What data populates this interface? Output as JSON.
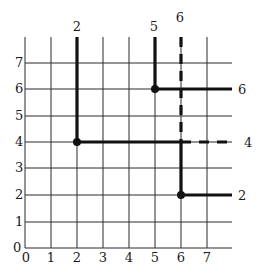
{
  "diagram": {
    "type": "grid-path-diagram",
    "grid": {
      "x_ticks": [
        "0",
        "1",
        "2",
        "3",
        "4",
        "5",
        "6",
        "7"
      ],
      "y_ticks": [
        "0",
        "1",
        "2",
        "3",
        "4",
        "5",
        "6",
        "7"
      ],
      "x_range": [
        0,
        8
      ],
      "y_range": [
        0,
        8.2
      ],
      "line_color": "#222222"
    },
    "paths": [
      {
        "id": "path-2-to-4",
        "style": "solid",
        "points": [
          [
            2,
            8.2
          ],
          [
            2,
            4
          ],
          [
            6,
            4
          ]
        ],
        "top_label": "2",
        "node": [
          2,
          4
        ]
      },
      {
        "id": "path-4-dashed",
        "style": "dashed",
        "points": [
          [
            6,
            4
          ],
          [
            8,
            4
          ]
        ],
        "end_label": "4"
      },
      {
        "id": "path-5-to-6",
        "style": "solid",
        "points": [
          [
            5,
            8.2
          ],
          [
            5,
            6
          ],
          [
            8,
            6
          ]
        ],
        "top_label": "5",
        "end_label": "6",
        "node": [
          5,
          6
        ]
      },
      {
        "id": "path-6-dashed",
        "style": "dashed",
        "points": [
          [
            6,
            8.2
          ],
          [
            6,
            4
          ]
        ],
        "top_label": "6"
      },
      {
        "id": "path-6-to-2",
        "style": "solid",
        "points": [
          [
            6,
            4
          ],
          [
            6,
            2
          ],
          [
            8,
            2
          ]
        ],
        "end_label": "2",
        "node": [
          6,
          2
        ]
      }
    ],
    "labels": {
      "top_2": "2",
      "top_5": "5",
      "top_6": "6",
      "right_6": "6",
      "right_4": "4",
      "right_2": "2",
      "origin_y": "0"
    }
  }
}
